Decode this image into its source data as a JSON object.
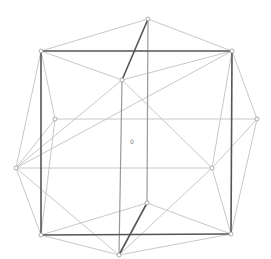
{
  "diagram": {
    "type": "graph",
    "center_label": "0",
    "center_label_pos": [
      132,
      142
    ],
    "colors": {
      "dark": "#555555",
      "medium": "#999999",
      "light": "#c8c8c8",
      "node_fill": "#ffffff",
      "node_stroke": "#999999"
    },
    "nodes": [
      {
        "id": "A",
        "x": 148,
        "y": 19
      },
      {
        "id": "B",
        "x": 41,
        "y": 51
      },
      {
        "id": "C",
        "x": 232,
        "y": 51
      },
      {
        "id": "D",
        "x": 122,
        "y": 80
      },
      {
        "id": "E",
        "x": 55,
        "y": 119
      },
      {
        "id": "F",
        "x": 257,
        "y": 119
      },
      {
        "id": "G",
        "x": 16,
        "y": 168
      },
      {
        "id": "H",
        "x": 212,
        "y": 168
      },
      {
        "id": "I",
        "x": 147,
        "y": 203
      },
      {
        "id": "J",
        "x": 41,
        "y": 235
      },
      {
        "id": "K",
        "x": 231,
        "y": 234
      },
      {
        "id": "L",
        "x": 119,
        "y": 255
      }
    ],
    "edges": [
      {
        "from": "A",
        "to": "B",
        "weight": "light"
      },
      {
        "from": "A",
        "to": "C",
        "weight": "light"
      },
      {
        "from": "B",
        "to": "D",
        "weight": "light"
      },
      {
        "from": "C",
        "to": "D",
        "weight": "light"
      },
      {
        "from": "B",
        "to": "E",
        "weight": "light"
      },
      {
        "from": "B",
        "to": "G",
        "weight": "light"
      },
      {
        "from": "C",
        "to": "F",
        "weight": "light"
      },
      {
        "from": "C",
        "to": "G",
        "weight": "light"
      },
      {
        "from": "C",
        "to": "H",
        "weight": "light"
      },
      {
        "from": "D",
        "to": "G",
        "weight": "light"
      },
      {
        "from": "D",
        "to": "H",
        "weight": "light"
      },
      {
        "from": "E",
        "to": "F",
        "weight": "light"
      },
      {
        "from": "E",
        "to": "G",
        "weight": "light"
      },
      {
        "from": "E",
        "to": "J",
        "weight": "light"
      },
      {
        "from": "F",
        "to": "H",
        "weight": "light"
      },
      {
        "from": "F",
        "to": "K",
        "weight": "light"
      },
      {
        "from": "G",
        "to": "H",
        "weight": "light"
      },
      {
        "from": "G",
        "to": "J",
        "weight": "light"
      },
      {
        "from": "G",
        "to": "L",
        "weight": "light"
      },
      {
        "from": "H",
        "to": "K",
        "weight": "light"
      },
      {
        "from": "H",
        "to": "L",
        "weight": "light"
      },
      {
        "from": "I",
        "to": "J",
        "weight": "light"
      },
      {
        "from": "I",
        "to": "K",
        "weight": "light"
      },
      {
        "from": "J",
        "to": "L",
        "weight": "light"
      },
      {
        "from": "K",
        "to": "L",
        "weight": "light"
      },
      {
        "from": "A",
        "to": "I",
        "weight": "medium"
      },
      {
        "from": "D",
        "to": "L",
        "weight": "medium"
      },
      {
        "from": "B",
        "to": "C",
        "weight": "dark"
      },
      {
        "from": "B",
        "to": "J",
        "weight": "dark"
      },
      {
        "from": "C",
        "to": "K",
        "weight": "dark"
      },
      {
        "from": "J",
        "to": "K",
        "weight": "dark"
      },
      {
        "from": "A",
        "to": "D",
        "weight": "dark"
      },
      {
        "from": "I",
        "to": "L",
        "weight": "dark"
      }
    ]
  }
}
